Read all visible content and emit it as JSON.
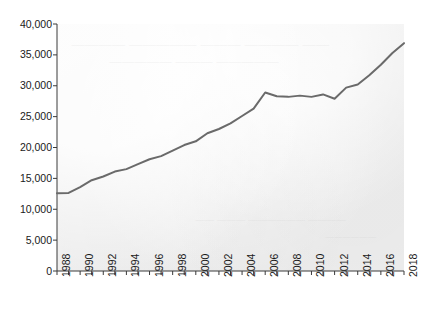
{
  "chart_data": {
    "type": "line",
    "title": "",
    "subtitle": "",
    "xlabel": "",
    "ylabel": "",
    "x": [
      1988,
      1989,
      1990,
      1991,
      1992,
      1993,
      1994,
      1995,
      1996,
      1997,
      1998,
      1999,
      2000,
      2001,
      2002,
      2003,
      2004,
      2005,
      2006,
      2007,
      2008,
      2009,
      2010,
      2011,
      2012,
      2013,
      2014,
      2015,
      2016,
      2017,
      2018
    ],
    "values": [
      12600,
      12650,
      13600,
      14700,
      15300,
      16100,
      16500,
      17300,
      18100,
      18600,
      19500,
      20400,
      21000,
      22300,
      23000,
      23900,
      25100,
      26300,
      28900,
      28300,
      28200,
      28400,
      28200,
      28600,
      27900,
      29700,
      30200,
      31700,
      33400,
      35300,
      36900
    ],
    "series": [
      {
        "name": "value",
        "values": [
          12600,
          12650,
          13600,
          14700,
          15300,
          16100,
          16500,
          17300,
          18100,
          18600,
          19500,
          20400,
          21000,
          22300,
          23000,
          23900,
          25100,
          26300,
          28900,
          28300,
          28200,
          28400,
          28200,
          28600,
          27900,
          29700,
          30200,
          31700,
          33400,
          35300,
          36900
        ],
        "color": "#6a6a6a"
      }
    ],
    "xlim": [
      1988,
      2018
    ],
    "ylim": [
      0,
      40000
    ],
    "y_ticks": [
      0,
      5000,
      10000,
      15000,
      20000,
      25000,
      30000,
      35000,
      40000
    ],
    "y_tick_labels": [
      "0",
      "5,000",
      "10,000",
      "15,000",
      "20,000",
      "25,000",
      "30,000",
      "35,000",
      "40,000"
    ],
    "x_ticks": [
      1988,
      1989,
      1990,
      1991,
      1992,
      1993,
      1994,
      1995,
      1996,
      1997,
      1998,
      1999,
      2000,
      2001,
      2002,
      2003,
      2004,
      2005,
      2006,
      2007,
      2008,
      2009,
      2010,
      2011,
      2012,
      2013,
      2014,
      2015,
      2016,
      2017,
      2018
    ],
    "x_tick_labels": [
      "1988",
      "1990",
      "1992",
      "1994",
      "1996",
      "1998",
      "2000",
      "2002",
      "2004",
      "2006",
      "2008",
      "2010",
      "2012",
      "2014",
      "2016",
      "2018"
    ],
    "x_tick_label_years": [
      1988,
      1990,
      1992,
      1994,
      1996,
      1998,
      2000,
      2002,
      2004,
      2006,
      2008,
      2010,
      2012,
      2014,
      2016,
      2018
    ],
    "x_label_rotation": -90,
    "grid": false,
    "legend": null,
    "legend_position": "none",
    "annotations": []
  },
  "style": {
    "plot_background": "#efefef",
    "page_background": "#ffffff",
    "line_color": "#6a6a6a",
    "line_width": 2,
    "axis_color": "#3a3a3a",
    "tick_label_color": "#1a1a1a"
  },
  "artifacts": {
    "description": "scanned-page bleed-through text, illegible mirrored print",
    "bleed_rows": [
      "—— ———— ——— ————— ————",
      "————— ——— —————",
      "———— —————— ——— ——",
      "——————"
    ]
  }
}
